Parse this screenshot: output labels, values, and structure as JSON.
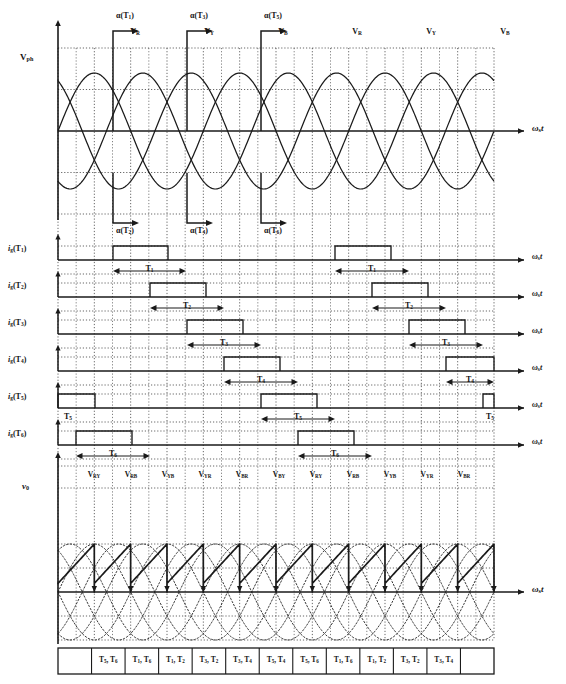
{
  "figure": {
    "type": "timing-diagram",
    "width": 566,
    "height": 684,
    "colors": {
      "line": "#1a1a1a",
      "grid": "#4a4a4a",
      "background": "#ffffff",
      "waveform": "#1a1a1a",
      "envelope": "#3a3a3a"
    }
  },
  "axes": {
    "omega_label": "ω",
    "omega_sub": "s",
    "omega_unit": "t",
    "vph_label": "V",
    "vph_sub": "ph",
    "vo_label": "v",
    "vo_sub": "0"
  },
  "firing_angles": {
    "top": [
      {
        "label": "α(T",
        "sub": "1",
        "close": ")",
        "x": 113
      },
      {
        "label": "α(T",
        "sub": "3",
        "close": ")",
        "x": 187
      },
      {
        "label": "α(T",
        "sub": "5",
        "close": ")",
        "x": 261
      }
    ],
    "bottom": [
      {
        "label": "α(T",
        "sub": "2",
        "close": ")",
        "x": 113
      },
      {
        "label": "α(T",
        "sub": "4",
        "close": ")",
        "x": 187
      },
      {
        "label": "α(T",
        "sub": "6",
        "close": ")",
        "x": 261
      }
    ]
  },
  "phase_labels": [
    {
      "text": "V",
      "sub": "R",
      "x": 113
    },
    {
      "text": "V",
      "sub": "Y",
      "x": 187
    },
    {
      "text": "V",
      "sub": "B",
      "x": 261
    },
    {
      "text": "V",
      "sub": "R",
      "x": 335
    },
    {
      "text": "V",
      "sub": "Y",
      "x": 409
    },
    {
      "text": "V",
      "sub": "B",
      "x": 483
    }
  ],
  "gate_rows": [
    {
      "name": "i",
      "sub": "g",
      "paren": "(T",
      "idx": "1",
      "close": ")",
      "dur": "T",
      "dur_sub": "1",
      "pulses": [
        {
          "start": 113,
          "end": 168
        },
        {
          "start": 335,
          "end": 391
        }
      ]
    },
    {
      "name": "i",
      "sub": "g",
      "paren": "(T",
      "idx": "2",
      "close": ")",
      "dur": "T",
      "dur_sub": "2",
      "pulses": [
        {
          "start": 150,
          "end": 206
        },
        {
          "start": 372,
          "end": 428
        }
      ]
    },
    {
      "name": "i",
      "sub": "g",
      "paren": "(T",
      "idx": "3",
      "close": ")",
      "dur": "T",
      "dur_sub": "3",
      "pulses": [
        {
          "start": 187,
          "end": 243
        },
        {
          "start": 409,
          "end": 465
        }
      ]
    },
    {
      "name": "i",
      "sub": "g",
      "paren": "(T",
      "idx": "4",
      "close": ")",
      "dur": "T",
      "dur_sub": "4",
      "pulses": [
        {
          "start": 224,
          "end": 280
        },
        {
          "start": 446,
          "end": 494
        }
      ]
    },
    {
      "name": "i",
      "sub": "g",
      "paren": "(T",
      "idx": "5",
      "close": ")",
      "dur": "T",
      "dur_sub": "5",
      "pulses": [
        {
          "start": 58,
          "end": 95
        },
        {
          "start": 261,
          "end": 317
        },
        {
          "start": 483,
          "end": 494
        }
      ]
    },
    {
      "name": "i",
      "sub": "g",
      "paren": "(T",
      "idx": "6",
      "close": ")",
      "dur": "T",
      "dur_sub": "6",
      "pulses": [
        {
          "start": 76,
          "end": 132
        },
        {
          "start": 298,
          "end": 354
        }
      ]
    }
  ],
  "output_segments": [
    {
      "text": "V",
      "sub": "RY",
      "x": 94
    },
    {
      "text": "V",
      "sub": "RB",
      "x": 131
    },
    {
      "text": "V",
      "sub": "YB",
      "x": 168
    },
    {
      "text": "V",
      "sub": "YR",
      "x": 205
    },
    {
      "text": "V",
      "sub": "BR",
      "x": 242
    },
    {
      "text": "V",
      "sub": "BY",
      "x": 279
    },
    {
      "text": "V",
      "sub": "RY",
      "x": 316
    },
    {
      "text": "V",
      "sub": "RB",
      "x": 353
    },
    {
      "text": "V",
      "sub": "YB",
      "x": 390
    },
    {
      "text": "V",
      "sub": "YR",
      "x": 427
    },
    {
      "text": "V",
      "sub": "BR",
      "x": 464
    }
  ],
  "conduction_table": {
    "cells": [
      {
        "a": "T",
        "a_sub": "5",
        "b": "T",
        "b_sub": "6"
      },
      {
        "a": "T",
        "a_sub": "1",
        "b": "T",
        "b_sub": "6"
      },
      {
        "a": "T",
        "a_sub": "1",
        "b": "T",
        "b_sub": "2"
      },
      {
        "a": "T",
        "a_sub": "3",
        "b": "T",
        "b_sub": "2"
      },
      {
        "a": "T",
        "a_sub": "3",
        "b": "T",
        "b_sub": "4"
      },
      {
        "a": "T",
        "a_sub": "5",
        "b": "T",
        "b_sub": "4"
      },
      {
        "a": "T",
        "a_sub": "5",
        "b": "T",
        "b_sub": "6"
      },
      {
        "a": "T",
        "a_sub": "1",
        "b": "T",
        "b_sub": "6"
      },
      {
        "a": "T",
        "a_sub": "1",
        "b": "T",
        "b_sub": "2"
      },
      {
        "a": "T",
        "a_sub": "3",
        "b": "T",
        "b_sub": "2"
      },
      {
        "a": "T",
        "a_sub": "3",
        "b": "T",
        "b_sub": "4"
      }
    ]
  },
  "chart_data": {
    "type": "line",
    "xlabel": "ωs t",
    "ylabel": "Vph / v0",
    "grid": true,
    "phase_count": 3,
    "phase_shift_deg": 120,
    "firing_angle_deg": 30,
    "series": [
      {
        "name": "V_R",
        "phase_deg": 0
      },
      {
        "name": "V_Y",
        "phase_deg": 120
      },
      {
        "name": "V_B",
        "phase_deg": 240
      }
    ]
  }
}
